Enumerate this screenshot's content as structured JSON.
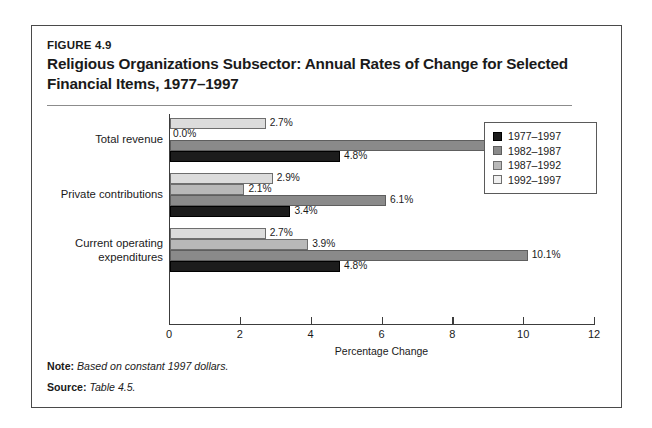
{
  "figure": {
    "number": "FIGURE 4.9",
    "title": "Religious Organizations Subsector: Annual Rates of Change for Selected Financial Items, 1977–1997"
  },
  "footer": {
    "note_key": "Note:",
    "note_value": "Based on constant 1997 dollars.",
    "source_key": "Source:",
    "source_value": "Table 4.5."
  },
  "legend": {
    "items": [
      {
        "label": "1977–1997",
        "color": "#1c1c1c",
        "key": "1977"
      },
      {
        "label": "1982–1987",
        "color": "#8a8a8a",
        "key": "1982"
      },
      {
        "label": "1987–1992",
        "color": "#b8b8b8",
        "key": "1987"
      },
      {
        "label": "1992–1997",
        "color": "#f0f0f0",
        "key": "1992"
      }
    ]
  },
  "chart_data": {
    "type": "bar",
    "orientation": "horizontal",
    "title": "Religious Organizations Subsector: Annual Rates of Change for Selected Financial Items, 1977–1997",
    "xlabel": "Percentage Change",
    "ylabel": "",
    "xlim": [
      0,
      12
    ],
    "xticks": [
      0,
      2,
      4,
      6,
      8,
      10,
      12
    ],
    "xtick_labels": [
      "0",
      "2",
      "4",
      "6",
      "8",
      "10",
      "12"
    ],
    "grid": false,
    "legend_position": "center-right",
    "categories": [
      "Total revenue",
      "Private contributions",
      "Current operating expenditures"
    ],
    "series": [
      {
        "name": "1977–1997",
        "color": "#1c1c1c",
        "values": [
          4.8,
          3.4,
          4.8
        ],
        "labels": [
          "4.8%",
          "3.4%",
          "4.8%"
        ]
      },
      {
        "name": "1982–1987",
        "color": "#8a8a8a",
        "values": [
          10.1,
          6.1,
          10.1
        ],
        "labels": [
          "10.1%",
          "6.1%",
          "10.1%"
        ]
      },
      {
        "name": "1987–1992",
        "color": "#b8b8b8",
        "values": [
          0.0,
          2.1,
          3.9
        ],
        "labels": [
          "0.0%",
          "2.1%",
          "3.9%"
        ]
      },
      {
        "name": "1992–1997",
        "color": "#dcdcdc",
        "values": [
          2.7,
          2.9,
          2.7
        ],
        "labels": [
          "2.7%",
          "2.9%",
          "2.7%"
        ]
      }
    ]
  }
}
